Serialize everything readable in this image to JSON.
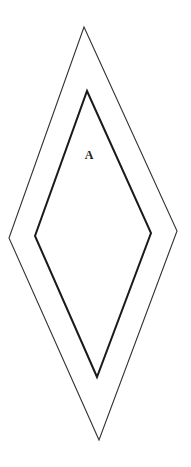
{
  "diagram": {
    "title": "",
    "canvas": {
      "width": 191,
      "height": 467,
      "background": "#ffffff"
    },
    "shapes": [
      {
        "id": "outer-rhombus",
        "type": "polygon",
        "points": [
          [
            84,
            27
          ],
          [
            177,
            231
          ],
          [
            99,
            440
          ],
          [
            9,
            238
          ]
        ],
        "stroke": "#333333",
        "stroke_width": 1.1,
        "fill": "none"
      },
      {
        "id": "inner-rhombus",
        "type": "polygon",
        "points": [
          [
            87,
            91
          ],
          [
            151,
            233
          ],
          [
            97,
            377
          ],
          [
            35,
            236
          ]
        ],
        "stroke": "#1a1a1a",
        "stroke_width": 2,
        "fill": "none"
      }
    ],
    "labels": [
      {
        "id": "label-a",
        "text": "A",
        "x": 89,
        "y": 159
      }
    ]
  }
}
